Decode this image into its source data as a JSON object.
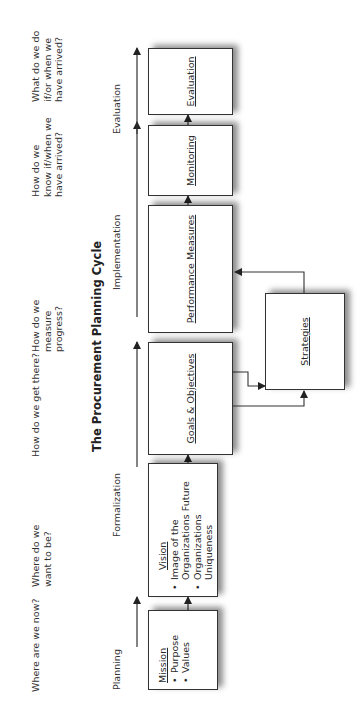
{
  "title": "The Procurement Planning Cycle",
  "questions": [
    "Where are we now?",
    "Where do we want to be?",
    "How do we get there?",
    "How do we measure progress?",
    "How do we know if/when we have arrived?",
    "What do we do if/or when we have arrived?"
  ],
  "phases": [
    "Planning",
    "Formalization",
    "Implementation",
    "Evaluation"
  ],
  "boxes": {
    "mission": {
      "heading": "Mission",
      "bullets": [
        "Purpose",
        "Values"
      ]
    },
    "vision": {
      "heading": "Vision",
      "bullets": [
        "Image of the Organizations Future",
        "Organizations Uniqueness"
      ]
    },
    "goals": {
      "heading": "Goals & Objectives"
    },
    "performance": {
      "heading": "Performance Measures"
    },
    "monitoring": {
      "heading": "Monitoring"
    },
    "evaluation": {
      "heading": "Evaluation"
    },
    "strategies": {
      "heading": "Strategies"
    }
  },
  "colors": {
    "line": "#333333",
    "text": "#2a2a2a",
    "background": "#ffffff"
  }
}
